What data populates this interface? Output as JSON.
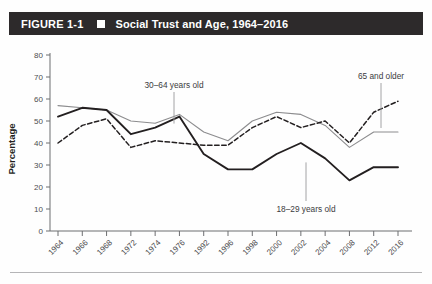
{
  "figure": {
    "number": "FIGURE 1-1",
    "separator_icon": "square-bullet-icon",
    "title": "Social Trust and Age, 1964–2016"
  },
  "chart_data": {
    "type": "line",
    "title": "Social Trust and Age, 1964–2016",
    "xlabel": "",
    "ylabel": "Percentage",
    "ylim": [
      0,
      80
    ],
    "ytick_step": 10,
    "yticks": [
      0,
      10,
      20,
      30,
      40,
      50,
      60,
      70,
      80
    ],
    "grid": false,
    "legend_position": "inline-annotations",
    "categories": [
      "1964",
      "1966",
      "1968",
      "1972",
      "1974",
      "1976",
      "1992",
      "1996",
      "1998",
      "2000",
      "2002",
      "2004",
      "2008",
      "2012",
      "2016"
    ],
    "series": [
      {
        "name": "65 and older",
        "style": "solid-thin-gray",
        "color": "#8c8c8e",
        "values": [
          57,
          56,
          55,
          50,
          49,
          53,
          45,
          41,
          50,
          54,
          53,
          48,
          38,
          45,
          45
        ]
      },
      {
        "name": "30–64 years old",
        "style": "solid-thick-black",
        "color": "#231f20",
        "values": [
          52,
          56,
          55,
          44,
          47,
          52,
          35,
          28,
          28,
          35,
          40,
          33,
          23,
          29,
          29
        ]
      },
      {
        "name": "18–29 years old",
        "style": "dashed-black",
        "color": "#231f20",
        "values": [
          40,
          48,
          51,
          38,
          41,
          40,
          39,
          39,
          47,
          52,
          47,
          50,
          40,
          54,
          59
        ]
      }
    ],
    "annotations": [
      {
        "text": "30–64 years old",
        "near_category": "1974",
        "label_x": 174,
        "label_y": 88
      },
      {
        "text": "65 and older",
        "near_category": "2012",
        "label_x": 381,
        "label_y": 79
      },
      {
        "text": "18–29 years old",
        "near_category": "2004",
        "label_x": 306,
        "label_y": 212
      }
    ]
  }
}
